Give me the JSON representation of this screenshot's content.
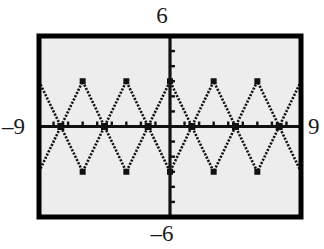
{
  "figure": {
    "kind": "graphing-calculator-screen",
    "background_color": "#ffffff",
    "plot_fill_color": "#ededed",
    "frame_color": "#000000",
    "ink_color": "#111111"
  },
  "labels": {
    "ymax": "6",
    "ymin": "–6",
    "xmin": "–9",
    "xmax": "9"
  },
  "chart_data": {
    "type": "line",
    "title": "",
    "xlabel": "",
    "ylabel": "",
    "xlim": [
      -9,
      9
    ],
    "ylim": [
      -6,
      6
    ],
    "grid": false,
    "xtick_step": 1,
    "ytick_step": 1,
    "axes_shown": [
      "x-axis",
      "y-axis"
    ],
    "tick_labels_x": [
      "-9",
      "9"
    ],
    "tick_labels_y": [
      "-6",
      "6"
    ],
    "series": [
      {
        "name": "zigzag-up",
        "description": "Triangle wave with period 6, amplitude 3, vertices alternating between y=3 and y=-3, peaks at x=-6, 0, 6",
        "x": [
          -9,
          -6,
          -3,
          0,
          3,
          6,
          9
        ],
        "values": [
          -3,
          3,
          -3,
          3,
          -3,
          3,
          -3
        ]
      },
      {
        "name": "zigzag-down",
        "description": "Triangle wave with period 6, amplitude 3, phase shifted by half period, peaks at x=-9, -3, 3, 9",
        "x": [
          -9,
          -6,
          -3,
          0,
          3,
          6,
          9
        ],
        "values": [
          3,
          -3,
          3,
          -3,
          3,
          -3,
          3
        ]
      }
    ],
    "intersections": [
      {
        "x": -7.5,
        "y": 0
      },
      {
        "x": -6,
        "y": 3
      },
      {
        "x": -6,
        "y": -3
      },
      {
        "x": -4.5,
        "y": 0
      },
      {
        "x": -3,
        "y": 3
      },
      {
        "x": -3,
        "y": -3
      },
      {
        "x": -1.5,
        "y": 0
      },
      {
        "x": 0,
        "y": 3
      },
      {
        "x": 0,
        "y": -3
      },
      {
        "x": 1.5,
        "y": 0
      },
      {
        "x": 3,
        "y": 3
      },
      {
        "x": 3,
        "y": -3
      },
      {
        "x": 4.5,
        "y": 0
      },
      {
        "x": 6,
        "y": 3
      },
      {
        "x": 6,
        "y": -3
      },
      {
        "x": 7.5,
        "y": 0
      }
    ]
  }
}
